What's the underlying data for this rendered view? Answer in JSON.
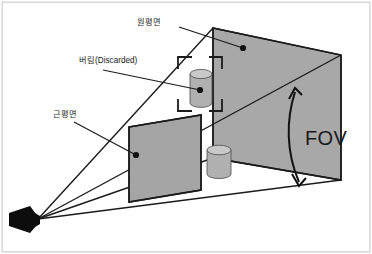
{
  "figure": {
    "background_color": "#ffffff",
    "border_color": "#d9d9d9",
    "line_color": "#1b1b1b",
    "plane_fill_color": "#a8a8a8",
    "near_plane_fill_color": "#a5a5a5",
    "cylinder_fill_color": "#b0b0b0",
    "cylinder_top_color": "#c8c8c8",
    "camera_color": "#0d0d0d"
  },
  "labels": {
    "far_plane": "원평면",
    "discarded": "버림(Discarded)",
    "near_plane": "근평면",
    "fov": "FOV"
  },
  "elements": {
    "camera_name": "camera",
    "far_plane_name": "far-plane",
    "near_plane_name": "near-plane",
    "discarded_object_name": "discarded-cylinder",
    "visible_object_name": "visible-cylinder",
    "fov_arrow_name": "fov-arrow"
  }
}
